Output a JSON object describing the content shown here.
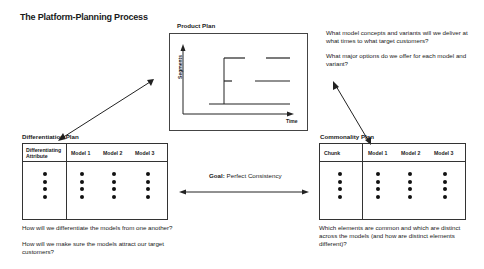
{
  "title": "The Platform-Planning Process",
  "product_plan": {
    "label": "Product Plan",
    "y_axis_label": "Segments",
    "x_axis_label": "Time",
    "questions": [
      "What model concepts and variants will we deliver at what times to what target customers?",
      "What major options do we offer for each model and variant?"
    ]
  },
  "differentiation_plan": {
    "label": "Differentiation Plan",
    "columns": [
      "Differentiating Attribute",
      "Model 1",
      "Model 2",
      "Model 3"
    ],
    "rows_placeholder": "• • • •",
    "questions": [
      "How will we differentiate the models from one another?",
      "How will we make sure the models attract our target customers?"
    ]
  },
  "commonality_plan": {
    "label": "Commonality Plan",
    "columns": [
      "Chunk",
      "Model 1",
      "Model 2",
      "Model 3"
    ],
    "rows_placeholder": "• • • •",
    "questions": [
      "Which elements are common and which are distinct across the models (and how are distinct elements different)?"
    ]
  },
  "goal": {
    "prefix": "Goal:",
    "text": "Perfect Consistency"
  }
}
